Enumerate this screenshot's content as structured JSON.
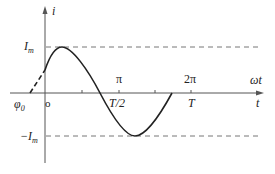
{
  "diagram": {
    "type": "sinusoid-waveform",
    "axes": {
      "vertical_label": "i",
      "horizontal_label_angle": "ωt",
      "horizontal_label_time": "t",
      "origin_label": "o"
    },
    "levels": {
      "max_label": "I",
      "max_sub": "m",
      "min_label": "−I",
      "min_sub": "m"
    },
    "phase_label": "φ",
    "phase_sub": "0",
    "ticks": {
      "pi": "π",
      "two_pi": "2π",
      "half_period": "T/2",
      "period": "T"
    },
    "colors": {
      "curve": "#222222",
      "axis": "#555555",
      "dashed": "#777777"
    }
  }
}
